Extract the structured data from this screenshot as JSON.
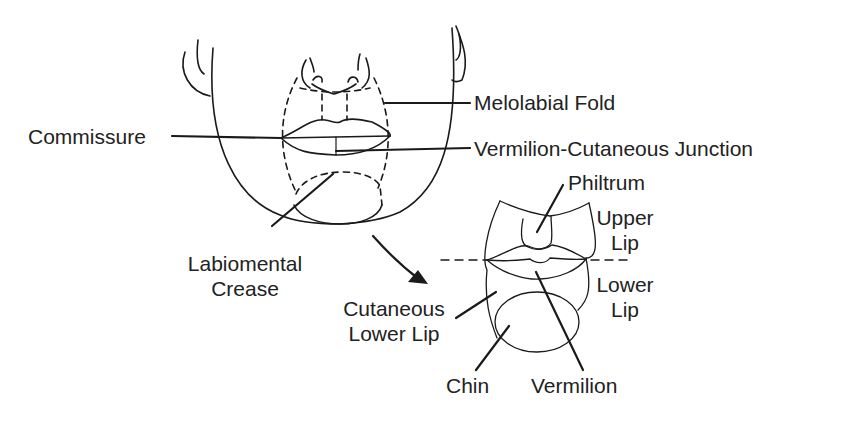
{
  "figure": {
    "colors": {
      "line": "#1a1a1a",
      "text": "#222222",
      "background": "#ffffff"
    }
  },
  "face_labels": {
    "melolabial_fold": "Melolabial Fold",
    "commissure": "Commissure",
    "vermilion_cutaneous_junction": "Vermilion-Cutaneous Junction",
    "labiomental_crease_line1": "Labiomental",
    "labiomental_crease_line2": "Crease"
  },
  "detail_labels": {
    "philtrum": "Philtrum",
    "upper_lip_line1": "Upper",
    "upper_lip_line2": "Lip",
    "lower_lip_line1": "Lower",
    "lower_lip_line2": "Lip",
    "cutaneous_lower_lip_line1": "Cutaneous",
    "cutaneous_lower_lip_line2": "Lower Lip",
    "chin": "Chin",
    "vermilion": "Vermilion"
  }
}
